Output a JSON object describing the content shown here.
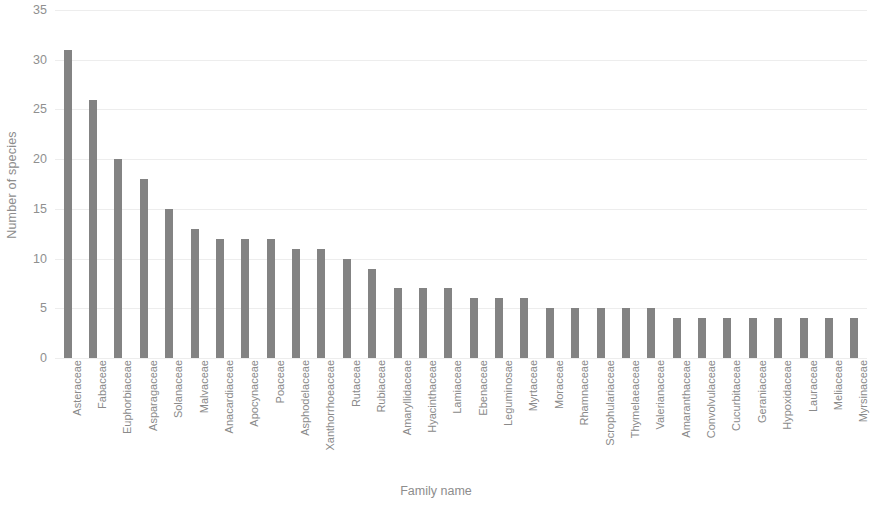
{
  "chart_data": {
    "type": "bar",
    "title": "",
    "xlabel": "Family name",
    "ylabel": "Number of species",
    "ylim": [
      0,
      35
    ],
    "ytick_step": 5,
    "yticks": [
      0,
      5,
      10,
      15,
      20,
      25,
      30,
      35
    ],
    "grid": true,
    "legend": false,
    "bar_color": "#838383",
    "orientation": "vertical",
    "categories": [
      "Asteraceae",
      "Fabaceae",
      "Euphorbiaceae",
      "Asparagaceae",
      "Solanaceae",
      "Malvaceae",
      "Anacardiaceae",
      "Apocynaceae",
      "Poaceae",
      "Asphodelaceae",
      "Xanthorrhoeaceae",
      "Rutaceae",
      "Rubiaceae",
      "Amaryllidaceae",
      "Hyacinthaceae",
      "Lamiaceae",
      "Ebenaceae",
      "Leguminosae",
      "Myrtaceae",
      "Moraceae",
      "Rhamnaceae",
      "Scrophulariaceae",
      "Thymelaeaceae",
      "Valerianaceae",
      "Amaranthaceae",
      "Convolvulaceae",
      "Cucurbitaceae",
      "Geraniaceae",
      "Hypoxidaceae",
      "Lauraceae",
      "Meliaceae",
      "Myrsinaceae"
    ],
    "values": [
      31,
      26,
      20,
      18,
      15,
      13,
      12,
      12,
      12,
      11,
      11,
      10,
      9,
      7,
      7,
      7,
      6,
      6,
      6,
      5,
      5,
      5,
      5,
      5,
      4,
      4,
      4,
      4,
      4,
      4,
      4,
      4
    ]
  }
}
